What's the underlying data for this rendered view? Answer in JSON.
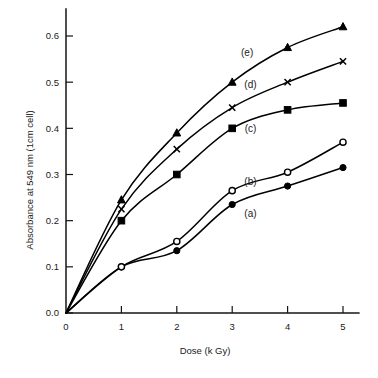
{
  "chart_data": {
    "type": "line",
    "title": "",
    "xlabel": "Dose (k Gy)",
    "ylabel": "Absorbance at 549 nm (1cm cell)",
    "xlim": [
      0,
      5.3
    ],
    "ylim": [
      0.0,
      0.66
    ],
    "xticks": [
      0,
      1,
      2,
      3,
      4,
      5
    ],
    "xticklabels": [
      "0",
      "1",
      "2",
      "3",
      "4",
      "5"
    ],
    "yticks": [
      0.0,
      0.1,
      0.2,
      0.3,
      0.4,
      0.5,
      0.6
    ],
    "yticklabels": [
      "0.0",
      "0.1",
      "0.2",
      "0.3",
      "0.4",
      "0.5",
      "0.6"
    ],
    "grid": false,
    "legend_position": "inline-annotations",
    "x": [
      0,
      1,
      2,
      3,
      4,
      5
    ],
    "series": [
      {
        "name": "(a)",
        "marker": "filled-circle",
        "values": [
          0.0,
          0.1,
          0.135,
          0.235,
          0.275,
          0.315
        ],
        "label_x": 3.33,
        "label_y": 0.215
      },
      {
        "name": "(b)",
        "marker": "open-circle",
        "values": [
          0.0,
          0.1,
          0.155,
          0.265,
          0.305,
          0.37
        ],
        "label_x": 3.33,
        "label_y": 0.285
      },
      {
        "name": "(c)",
        "marker": "filled-square",
        "values": [
          0.0,
          0.2,
          0.3,
          0.4,
          0.44,
          0.455
        ],
        "label_x": 3.33,
        "label_y": 0.4
      },
      {
        "name": "(d)",
        "marker": "cross",
        "values": [
          0.0,
          0.225,
          0.355,
          0.445,
          0.5,
          0.545
        ],
        "label_x": 3.33,
        "label_y": 0.495
      },
      {
        "name": "(e)",
        "marker": "filled-triangle",
        "values": [
          0.0,
          0.245,
          0.39,
          0.5,
          0.575,
          0.62
        ],
        "label_x": 3.27,
        "label_y": 0.565
      }
    ]
  },
  "axes": {
    "x_title": "Dose (k Gy)",
    "y_title": "Absorbance at 549 nm (1cm cell)"
  },
  "series_labels": {
    "a": "(a)",
    "b": "(b)",
    "c": "(c)",
    "d": "(d)",
    "e": "(e)"
  },
  "colors": {
    "ink": "#000000",
    "background": "#ffffff"
  }
}
